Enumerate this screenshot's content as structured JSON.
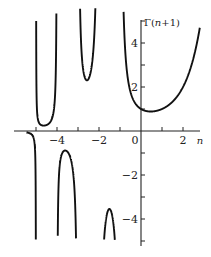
{
  "chart_data": {
    "type": "line",
    "title": "",
    "function": "Gamma(n+1)",
    "xlabel": "n",
    "ylabel": "Γ(n+1)",
    "xlim": [
      -5.4,
      3.0
    ],
    "ylim": [
      -5.2,
      5.8
    ],
    "grid": false,
    "legend": null,
    "x_ticks": [
      -5,
      -4,
      -3,
      -2,
      -1,
      0,
      1,
      2
    ],
    "x_tick_labels": [
      {
        "value": -4,
        "label": "-4"
      },
      {
        "value": -2,
        "label": "-2"
      },
      {
        "value": 0,
        "label": "0"
      },
      {
        "value": 2,
        "label": "2"
      }
    ],
    "y_ticks": [
      -5,
      -4,
      -3,
      -2,
      -1,
      1,
      2,
      3,
      4,
      5
    ],
    "y_tick_labels": [
      {
        "value": 4,
        "label": "4"
      },
      {
        "value": 2,
        "label": "2"
      },
      {
        "value": -2,
        "label": "-2"
      },
      {
        "value": -4,
        "label": "-4"
      }
    ],
    "poles": [
      -1,
      -2,
      -3,
      -4,
      -5
    ],
    "branches": [
      {
        "interval": [
          -1,
          2.8
        ],
        "sign": "positive",
        "min_point": [
          0.46,
          0.886
        ]
      },
      {
        "interval": [
          -2,
          -1
        ],
        "sign": "negative",
        "max_point": [
          -1.5,
          -3.545
        ]
      },
      {
        "interval": [
          -3,
          -2
        ],
        "sign": "positive",
        "min_point": [
          -2.5,
          2.363
        ]
      },
      {
        "interval": [
          -4,
          -3
        ],
        "sign": "negative",
        "max_point": [
          -3.5,
          -0.945
        ]
      },
      {
        "interval": [
          -5,
          -4
        ],
        "sign": "positive",
        "min_point": [
          -4.5,
          0.27
        ]
      },
      {
        "interval": [
          -5.4,
          -5
        ],
        "sign": "negative",
        "max_point": [
          -5.3,
          -0.05
        ]
      }
    ],
    "series": [
      {
        "name": "Γ(n+1)",
        "description": "Gamma function curve with vertical asymptotes at negative integers"
      }
    ]
  },
  "axes": {
    "x_label": "n",
    "y_label": "Γ(n+1)"
  }
}
